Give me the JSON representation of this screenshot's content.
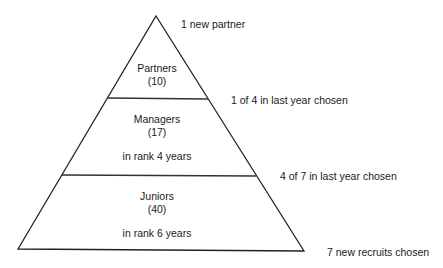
{
  "diagram": {
    "type": "pyramid",
    "tiers": [
      {
        "name": "Partners",
        "count": "(10)",
        "tenure": ""
      },
      {
        "name": "Managers",
        "count": "(17)",
        "tenure": "in rank 4 years"
      },
      {
        "name": "Juniors",
        "count": "(40)",
        "tenure": "in rank 6 years"
      }
    ],
    "annotations": {
      "top": "1 new partner",
      "partners_managers": "1 of 4 in last year chosen",
      "managers_juniors": "4 of 7 in last year chosen",
      "base": "7 new recruits chosen"
    }
  }
}
